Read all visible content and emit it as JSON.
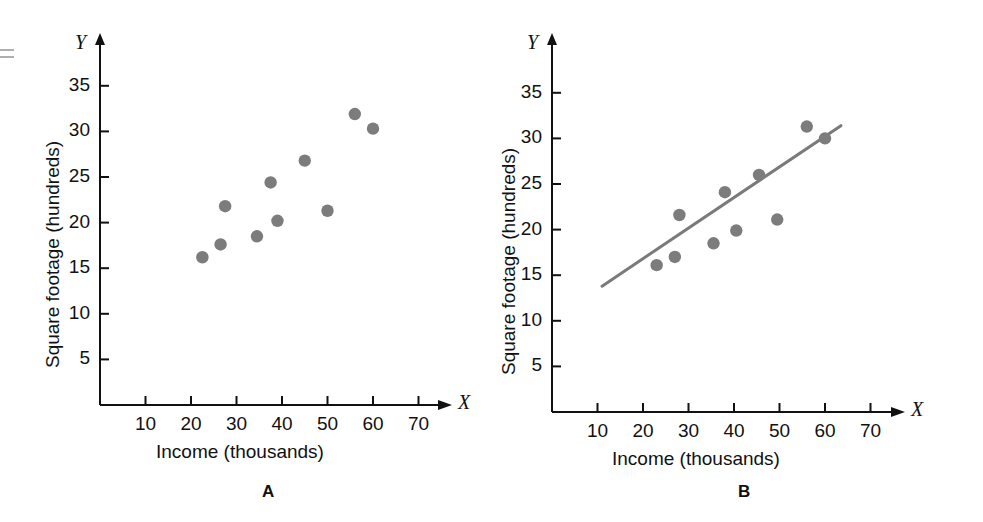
{
  "figure": {
    "background_color": "#ffffff",
    "axis_color": "#111111",
    "point_color": "#7c7c7c",
    "line_color": "#7a7a7a"
  },
  "panels": [
    {
      "id": "A",
      "caption": "A",
      "x_axis_letter": "X",
      "y_axis_letter": "Y"
    },
    {
      "id": "B",
      "caption": "B",
      "x_axis_letter": "X",
      "y_axis_letter": "Y"
    }
  ],
  "chart_data": [
    {
      "type": "scatter",
      "panel": "A",
      "title": "",
      "xlabel": "Income (thousands)",
      "ylabel": "Square footage (hundreds)",
      "xlim": [
        0,
        78
      ],
      "ylim": [
        0,
        39
      ],
      "xticks": [
        10,
        20,
        30,
        40,
        50,
        60,
        70
      ],
      "xticklabels": [
        "10",
        "20",
        "30",
        "40",
        "50",
        "60",
        "70"
      ],
      "yticks": [
        5,
        10,
        15,
        20,
        25,
        30,
        35
      ],
      "yticklabels": [
        "5",
        "10",
        "15",
        "20",
        "25",
        "30",
        "35"
      ],
      "grid": false,
      "legend": false,
      "points": [
        {
          "x": 22.5,
          "y": 16.2
        },
        {
          "x": 26.5,
          "y": 17.6
        },
        {
          "x": 27.5,
          "y": 21.8
        },
        {
          "x": 34.5,
          "y": 18.5
        },
        {
          "x": 37.5,
          "y": 24.4
        },
        {
          "x": 39.0,
          "y": 20.2
        },
        {
          "x": 45.0,
          "y": 26.8
        },
        {
          "x": 50.0,
          "y": 21.3
        },
        {
          "x": 56.0,
          "y": 31.9
        },
        {
          "x": 60.0,
          "y": 30.3
        }
      ],
      "regression_line": null
    },
    {
      "type": "scatter",
      "panel": "B",
      "title": "",
      "xlabel": "Income (thousands)",
      "ylabel": "Square footage (hundreds)",
      "xlim": [
        0,
        78
      ],
      "ylim": [
        0,
        39
      ],
      "xticks": [
        10,
        20,
        30,
        40,
        50,
        60,
        70
      ],
      "xticklabels": [
        "10",
        "20",
        "30",
        "40",
        "50",
        "60",
        "70"
      ],
      "yticks": [
        5,
        10,
        15,
        20,
        25,
        30,
        35
      ],
      "yticklabels": [
        "5",
        "10",
        "15",
        "20",
        "25",
        "30",
        "35"
      ],
      "grid": false,
      "legend": false,
      "points": [
        {
          "x": 23.0,
          "y": 16.1
        },
        {
          "x": 27.0,
          "y": 17.0
        },
        {
          "x": 28.0,
          "y": 21.6
        },
        {
          "x": 35.5,
          "y": 18.5
        },
        {
          "x": 38.0,
          "y": 24.1
        },
        {
          "x": 40.5,
          "y": 19.9
        },
        {
          "x": 45.5,
          "y": 26.0
        },
        {
          "x": 49.5,
          "y": 21.1
        },
        {
          "x": 56.0,
          "y": 31.3
        },
        {
          "x": 60.0,
          "y": 30.0
        }
      ],
      "regression_line": {
        "x_start": 11.0,
        "y_start": 13.8,
        "x_end": 63.5,
        "y_end": 31.4
      }
    }
  ]
}
